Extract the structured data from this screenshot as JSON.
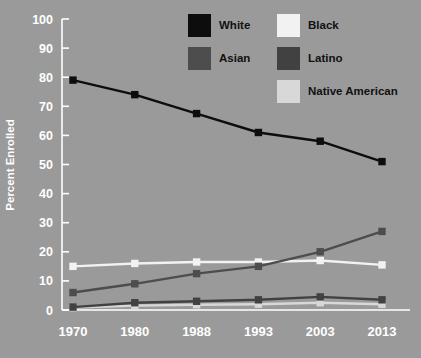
{
  "chart_data": {
    "type": "line",
    "title": "",
    "xlabel": "",
    "ylabel": "Percent Enrolled",
    "categories": [
      "1970",
      "1980",
      "1988",
      "1993",
      "2003",
      "2013"
    ],
    "ylim": [
      0,
      100
    ],
    "yticks": [
      "0",
      "10",
      "20",
      "30",
      "40",
      "50",
      "60",
      "70",
      "80",
      "90",
      "100"
    ],
    "grid": false,
    "legend_position": "top-center",
    "series": [
      {
        "name": "White",
        "color": "#0d0d0d",
        "marker": "square",
        "values": [
          79,
          74,
          67.5,
          61,
          58,
          51
        ]
      },
      {
        "name": "Black",
        "color": "#f2f2f2",
        "marker": "square",
        "values": [
          15,
          16,
          16.5,
          16.5,
          17,
          15.5
        ]
      },
      {
        "name": "Asian",
        "color": "#4d4d4d",
        "marker": "square",
        "values": [
          6,
          9,
          12.5,
          15,
          20,
          27
        ]
      },
      {
        "name": "Latino",
        "color": "#414141",
        "marker": "square",
        "values": [
          1,
          2.5,
          3,
          3.5,
          4.5,
          3.5
        ]
      },
      {
        "name": "Native American",
        "color": "#d8d8d8",
        "marker": "square",
        "values": [
          0.8,
          1.5,
          1.8,
          2,
          2.5,
          2
        ]
      }
    ]
  },
  "legend": {
    "entries": [
      {
        "label": "White",
        "color": "#0d0d0d"
      },
      {
        "label": "Black",
        "color": "#f2f2f2"
      },
      {
        "label": "Asian",
        "color": "#4d4d4d"
      },
      {
        "label": "Latino",
        "color": "#414141"
      },
      {
        "label": "Native American",
        "color": "#d8d8d8"
      }
    ]
  },
  "colors": {
    "background": "#9a9a9a",
    "axis": "#ffffff",
    "tick_text": "#ffffff",
    "legend_text": "#111111"
  }
}
